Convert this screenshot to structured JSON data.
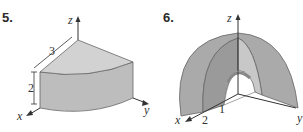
{
  "figures": [
    {
      "number": "5.",
      "description": "Quarter-cylinder solid in first octant",
      "labels": {
        "z": "z",
        "x": "x",
        "y": "y",
        "radius": "3",
        "height": "2"
      },
      "colors": {
        "top": "#cfcfcf",
        "side": "#bdbdbd",
        "edge": "#555555"
      }
    },
    {
      "number": "6.",
      "description": "Quarter of spherical shell with inner radius 1 and outer radius 2",
      "labels": {
        "z": "z",
        "x": "x",
        "y": "y",
        "inner_radius": "1",
        "outer_radius": "2"
      },
      "colors": {
        "outer": "#a9a9a9",
        "face": "#c8c8c8",
        "inner": "#8f8f8f"
      }
    }
  ]
}
